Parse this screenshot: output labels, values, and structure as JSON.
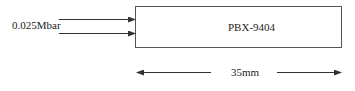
{
  "diagram": {
    "pressure_label": "0.025Mbar",
    "block_label": "PBX-9404",
    "dimension_label": "35mm"
  },
  "colors": {
    "stroke": "#333333",
    "text": "#222222"
  }
}
